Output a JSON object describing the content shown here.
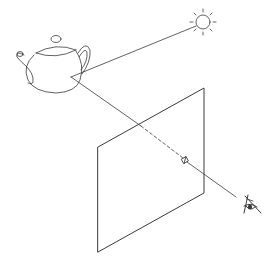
{
  "diagram": {
    "type": "ray-tracing-illustration",
    "elements": {
      "object": {
        "name": "teapot",
        "hit_point": [
          71,
          77
        ]
      },
      "light": {
        "name": "sun",
        "center": [
          203,
          22
        ],
        "radius": 8,
        "rays": 8
      },
      "image_plane": {
        "name": "image-plane",
        "corners": [
          [
            98,
            147
          ],
          [
            204,
            88
          ],
          [
            204,
            193
          ],
          [
            98,
            252
          ]
        ]
      },
      "pixel": {
        "name": "pixel",
        "center": [
          185,
          160
        ]
      },
      "eye": {
        "name": "eye",
        "position": [
          238,
          198
        ]
      }
    },
    "rays": [
      {
        "name": "shadow-ray",
        "from": "teapot",
        "to": "sun"
      },
      {
        "name": "view-ray",
        "from": "eye",
        "through": "pixel",
        "to": "teapot",
        "hidden_segment": "dashed"
      }
    ],
    "colors": {
      "line": "#3a3a3a",
      "background": "#ffffff"
    }
  }
}
